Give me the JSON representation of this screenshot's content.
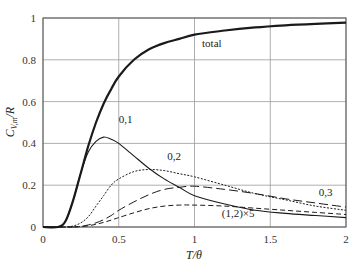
{
  "chart_data": {
    "type": "line",
    "title": "",
    "xlabel": "T/θ",
    "ylabel": "C_V,m/R",
    "xlim": [
      0,
      2
    ],
    "ylim": [
      0,
      1
    ],
    "grid": true,
    "legend": "inline labels",
    "x_ticks": [
      "0",
      "0.5",
      "1",
      "1.5",
      "2"
    ],
    "y_ticks": [
      "0",
      "0.2",
      "0.4",
      "0.6",
      "0.8",
      "1"
    ],
    "x": [
      0,
      0.1,
      0.15,
      0.2,
      0.25,
      0.3,
      0.35,
      0.4,
      0.45,
      0.5,
      0.6,
      0.7,
      0.8,
      0.9,
      1.0,
      1.2,
      1.4,
      1.6,
      1.8,
      2.0
    ],
    "series": [
      {
        "name": "total",
        "style": "solid-thick",
        "values": [
          0,
          0.0,
          0.03,
          0.13,
          0.26,
          0.39,
          0.5,
          0.59,
          0.66,
          0.72,
          0.8,
          0.85,
          0.88,
          0.9,
          0.92,
          0.94,
          0.955,
          0.965,
          0.972,
          0.978
        ]
      },
      {
        "name": "0,1",
        "style": "solid",
        "values": [
          0,
          0.0,
          0.03,
          0.13,
          0.26,
          0.36,
          0.41,
          0.43,
          0.42,
          0.4,
          0.34,
          0.28,
          0.23,
          0.19,
          0.15,
          0.11,
          0.08,
          0.065,
          0.055,
          0.045
        ]
      },
      {
        "name": "0,2",
        "style": "dotted",
        "values": [
          0,
          0,
          0,
          0.005,
          0.02,
          0.05,
          0.1,
          0.15,
          0.2,
          0.23,
          0.265,
          0.275,
          0.27,
          0.255,
          0.24,
          0.2,
          0.16,
          0.13,
          0.1,
          0.08
        ]
      },
      {
        "name": "0,3",
        "style": "long-dash",
        "values": [
          0,
          0,
          0,
          0,
          0.002,
          0.01,
          0.02,
          0.035,
          0.055,
          0.08,
          0.12,
          0.155,
          0.18,
          0.19,
          0.195,
          0.18,
          0.16,
          0.135,
          0.115,
          0.095
        ]
      },
      {
        "name": "(1,2)×5",
        "style": "short-dash",
        "values": [
          0,
          0,
          0,
          0,
          0.002,
          0.006,
          0.013,
          0.022,
          0.033,
          0.045,
          0.068,
          0.088,
          0.1,
          0.105,
          0.105,
          0.1,
          0.09,
          0.08,
          0.07,
          0.06
        ]
      }
    ],
    "annotations": [
      {
        "text": "total",
        "x": 1.05,
        "y": 0.86
      },
      {
        "text": "0,1",
        "x": 0.5,
        "y": 0.5
      },
      {
        "text": "0,2",
        "x": 0.82,
        "y": 0.32
      },
      {
        "text": "0,3",
        "x": 1.82,
        "y": 0.15
      },
      {
        "text": "(1,2)×5",
        "x": 1.18,
        "y": 0.05
      }
    ]
  }
}
